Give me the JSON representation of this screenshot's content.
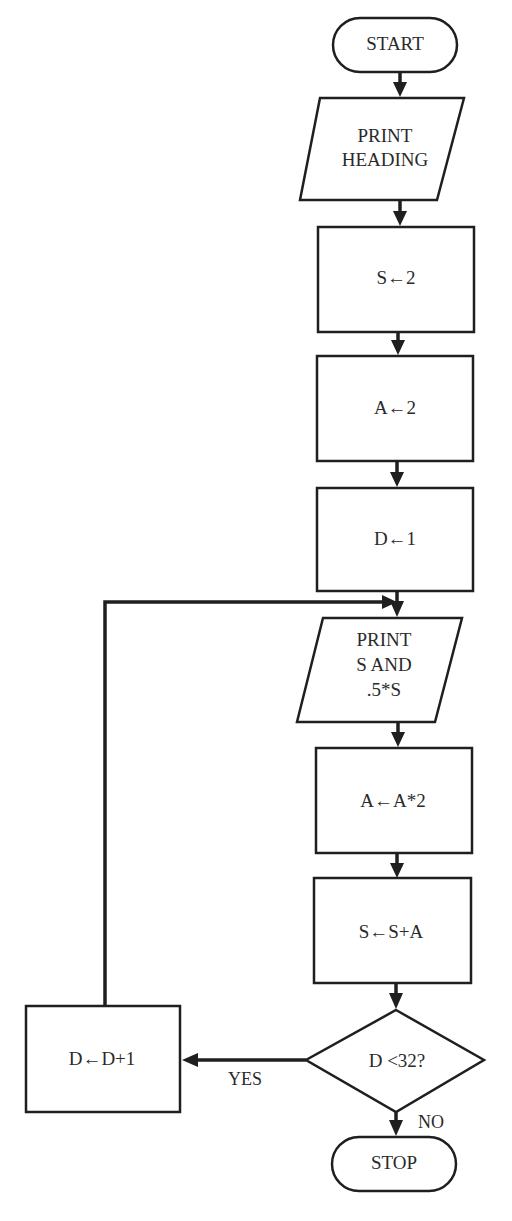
{
  "diagram": {
    "type": "flowchart",
    "nodes": [
      {
        "id": "start",
        "shape": "terminator",
        "label": "START"
      },
      {
        "id": "print_heading",
        "shape": "parallelogram",
        "lines": [
          "PRINT",
          "HEADING"
        ]
      },
      {
        "id": "s_init",
        "shape": "process",
        "label": "S←2"
      },
      {
        "id": "a_init",
        "shape": "process",
        "label": "A←2"
      },
      {
        "id": "d_init",
        "shape": "process",
        "label": "D←1"
      },
      {
        "id": "print_s",
        "shape": "parallelogram",
        "lines": [
          "PRINT",
          "S AND",
          ".5*S"
        ]
      },
      {
        "id": "a_double",
        "shape": "process",
        "label": "A←A*2"
      },
      {
        "id": "s_add",
        "shape": "process",
        "label": "S←S+A"
      },
      {
        "id": "decision",
        "shape": "diamond",
        "label": "D <32?"
      },
      {
        "id": "d_inc",
        "shape": "process",
        "label": "D←D+1"
      },
      {
        "id": "stop",
        "shape": "terminator",
        "label": "STOP"
      }
    ],
    "edges": [
      {
        "from": "start",
        "to": "print_heading",
        "label": ""
      },
      {
        "from": "print_heading",
        "to": "s_init",
        "label": ""
      },
      {
        "from": "s_init",
        "to": "a_init",
        "label": ""
      },
      {
        "from": "a_init",
        "to": "d_init",
        "label": ""
      },
      {
        "from": "d_init",
        "to": "print_s",
        "label": ""
      },
      {
        "from": "print_s",
        "to": "a_double",
        "label": ""
      },
      {
        "from": "a_double",
        "to": "s_add",
        "label": ""
      },
      {
        "from": "s_add",
        "to": "decision",
        "label": ""
      },
      {
        "from": "decision",
        "to": "d_inc",
        "label": "YES"
      },
      {
        "from": "decision",
        "to": "stop",
        "label": "NO"
      },
      {
        "from": "d_inc",
        "to": "print_s",
        "label": ""
      }
    ]
  },
  "colors": {
    "stroke": "#1f1f1f",
    "text": "#2a2a2a",
    "background": "#ffffff"
  }
}
